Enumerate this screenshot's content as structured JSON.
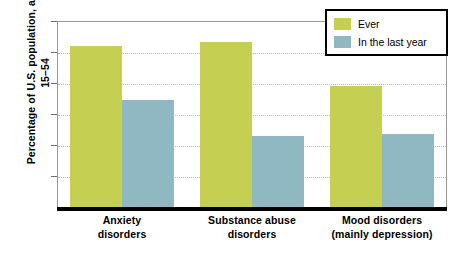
{
  "chart_data": {
    "type": "bar",
    "title": "",
    "xlabel": "",
    "ylabel": "Percentage of U.S. population, ages 15–54",
    "ylim": [
      0,
      30
    ],
    "ytick_step": 5,
    "yticks": [
      0,
      5,
      10,
      15,
      20,
      25,
      30
    ],
    "ytick_labels": [
      "0",
      "5",
      "10",
      "15",
      "20",
      "25",
      "30"
    ],
    "grid": true,
    "grid_axis": "y",
    "grid_style": "dotted",
    "legend_position": "top-right",
    "categories": [
      "Anxiety disorders",
      "Substance abuse disorders",
      "Mood disorders (mainly depression)"
    ],
    "category_lines": [
      [
        "Anxiety",
        "disorders"
      ],
      [
        "Substance abuse",
        "disorders"
      ],
      [
        "Mood disorders",
        "(mainly depression)"
      ]
    ],
    "series": [
      {
        "name": "Ever",
        "color": "#c5cf52",
        "values": [
          26.0,
          26.6,
          19.5
        ]
      },
      {
        "name": "In the last year",
        "color": "#8fb8c3",
        "values": [
          17.3,
          11.5,
          11.7
        ]
      }
    ]
  },
  "axis": {
    "y_title": "Percentage of U.S. population, ages 15–54",
    "y_title_line1": "Percentage of U.S.",
    "y_title_line2": "population, ages 15–54"
  },
  "legend": {
    "items": [
      {
        "label": "Ever",
        "color": "#c5cf52"
      },
      {
        "label": "In the last year",
        "color": "#8fb8c3"
      }
    ]
  },
  "colors": {
    "series_ever": "#c5cf52",
    "series_last_year": "#8fb8c3",
    "axis_line": "#000000",
    "plot_border": "#9a9a9a",
    "gridline": "#b9b9b9",
    "background": "#ffffff"
  }
}
